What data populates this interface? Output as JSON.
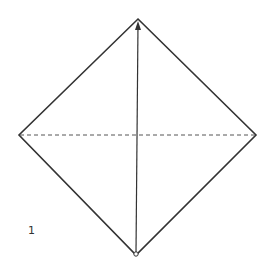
{
  "diagram": {
    "type": "origami-fold-step",
    "step_number": "1",
    "colors": {
      "line": "#333333",
      "background": "#ffffff"
    },
    "shape": {
      "name": "square-diamond",
      "vertices": {
        "top": [
          138,
          19
        ],
        "right": [
          256,
          135
        ],
        "bottom": [
          136,
          255
        ],
        "left": [
          19,
          135
        ]
      }
    },
    "fold_lines": [
      {
        "kind": "valley-fold-dashed",
        "from": "left",
        "to": "right"
      }
    ],
    "arrows": [
      {
        "kind": "fold-arrow",
        "from": "bottom",
        "to": "top"
      }
    ]
  }
}
